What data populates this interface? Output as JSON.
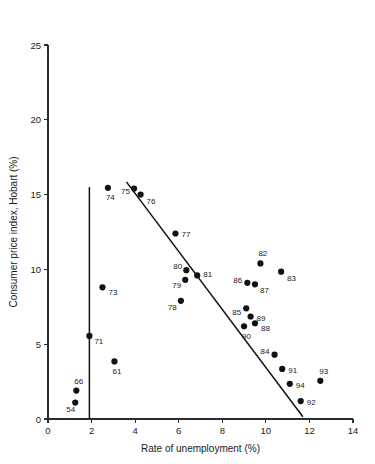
{
  "chart_data": {
    "type": "scatter",
    "title": "",
    "xlabel": "Rate of unemployment (%)",
    "ylabel": "Consumer price index, Hobart (%)",
    "xlim": [
      0,
      14
    ],
    "ylim": [
      0,
      25
    ],
    "xticks": [
      0,
      2,
      4,
      6,
      8,
      10,
      12,
      14
    ],
    "yticks": [
      0,
      5,
      10,
      15,
      20,
      25
    ],
    "grid": false,
    "legend": "none",
    "point_color": "#111111",
    "line_color": "#111111",
    "points": [
      {
        "label": "54",
        "x": 1.25,
        "y": 1.1,
        "lx": -9,
        "ly": 9
      },
      {
        "label": "66",
        "x": 1.3,
        "y": 1.9,
        "lx": -2,
        "ly": -7
      },
      {
        "label": "71",
        "x": 1.9,
        "y": 5.55,
        "lx": 5,
        "ly": 8
      },
      {
        "label": "61",
        "x": 3.05,
        "y": 3.85,
        "lx": -2,
        "ly": 13
      },
      {
        "label": "73",
        "x": 2.5,
        "y": 8.8,
        "lx": 6,
        "ly": 8
      },
      {
        "label": "74",
        "x": 2.75,
        "y": 15.45,
        "lx": -2,
        "ly": 12
      },
      {
        "label": "75",
        "x": 3.95,
        "y": 15.4,
        "lx": -13,
        "ly": 5
      },
      {
        "label": "76",
        "x": 4.25,
        "y": 15.0,
        "lx": 6,
        "ly": 9
      },
      {
        "label": "77",
        "x": 5.85,
        "y": 12.4,
        "lx": 6,
        "ly": 4
      },
      {
        "label": "78",
        "x": 6.1,
        "y": 7.9,
        "lx": -13,
        "ly": 9
      },
      {
        "label": "79",
        "x": 6.3,
        "y": 9.3,
        "lx": -13,
        "ly": 8
      },
      {
        "label": "80",
        "x": 6.35,
        "y": 9.95,
        "lx": -13,
        "ly": -1
      },
      {
        "label": "81",
        "x": 6.85,
        "y": 9.6,
        "lx": 6,
        "ly": 2
      },
      {
        "label": "82",
        "x": 9.75,
        "y": 10.4,
        "lx": -2,
        "ly": -7
      },
      {
        "label": "83",
        "x": 10.7,
        "y": 9.85,
        "lx": 6,
        "ly": 9
      },
      {
        "label": "84",
        "x": 10.4,
        "y": 4.3,
        "lx": -14,
        "ly": -1
      },
      {
        "label": "85",
        "x": 9.1,
        "y": 7.4,
        "lx": -14,
        "ly": 7
      },
      {
        "label": "86",
        "x": 9.15,
        "y": 9.1,
        "lx": -14,
        "ly": 0
      },
      {
        "label": "87",
        "x": 9.5,
        "y": 9.0,
        "lx": 5,
        "ly": 9
      },
      {
        "label": "88",
        "x": 9.5,
        "y": 6.4,
        "lx": 6,
        "ly": 8
      },
      {
        "label": "89",
        "x": 9.3,
        "y": 6.85,
        "lx": 6,
        "ly": 4
      },
      {
        "label": "90",
        "x": 9.0,
        "y": 6.2,
        "lx": -2,
        "ly": 13
      },
      {
        "label": "91",
        "x": 10.75,
        "y": 3.35,
        "lx": 6,
        "ly": 4
      },
      {
        "label": "92",
        "x": 11.6,
        "y": 1.2,
        "lx": 6,
        "ly": 4
      },
      {
        "label": "93",
        "x": 12.5,
        "y": 2.55,
        "lx": -1,
        "ly": -7
      },
      {
        "label": "94",
        "x": 11.1,
        "y": 2.35,
        "lx": 6,
        "ly": 4
      }
    ],
    "lines": [
      {
        "name": "regression-line",
        "x1": 3.6,
        "y1": 15.85,
        "x2": 11.7,
        "y2": 0.15
      },
      {
        "name": "vertical-reference-line",
        "x1": 1.9,
        "y1": 0.0,
        "x2": 1.9,
        "y2": 15.5
      }
    ]
  }
}
